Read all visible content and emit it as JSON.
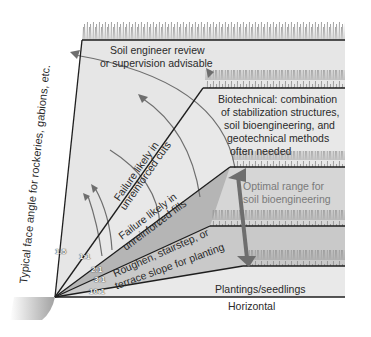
{
  "diagram": {
    "side_label": "Typical face angle for rockeries, gabions, etc.",
    "zones": {
      "top": "Soil engineer review",
      "top2": "or supervision advisable",
      "cuts1": "Failure likely in",
      "cuts2": "unreinforced cuts",
      "fills1": "Failure likely in",
      "fills2": "unreinforced fills",
      "roughen1": "Roughen, stairstep, or",
      "roughen2": "terrace slope for planting",
      "plantings": "Plantings/seedlings",
      "horizontal": "Horizontal"
    },
    "biotechnical": {
      "line1": "Biotechnical: combination",
      "line2": "of stabilization structures,",
      "line3": "soil bioengineering, and",
      "line4": "geotechnical methods",
      "line5": "often needed"
    },
    "optimal": {
      "line1": "Optimal range for",
      "line2": "soil bioengineering"
    },
    "ratios": [
      "1.5",
      "1:1",
      "2:1",
      "3:1",
      "10:1"
    ],
    "colors": {
      "fill_light": "#e4e4e4",
      "fill_mid": "#cfcfcf",
      "fill_dark": "#b4b4b4",
      "line": "#1e1e1e",
      "arrow": "#6e6e6e",
      "optimal_text": "#7a7a7a"
    }
  }
}
